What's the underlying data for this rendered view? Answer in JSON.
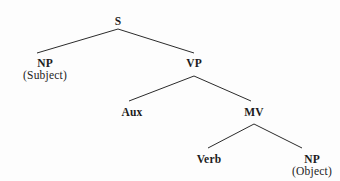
{
  "diagram": {
    "type": "syntax-tree",
    "background_color": "#fdfdfd",
    "line_color": "#2b2b2b",
    "text_color": "#1c1c1c",
    "nodes": [
      {
        "id": "s",
        "category": "S",
        "role": "",
        "x": 118,
        "y": 22
      },
      {
        "id": "np_sub",
        "category": "NP",
        "role": "(Subject)",
        "x": 45,
        "y": 63
      },
      {
        "id": "vp",
        "category": "VP",
        "role": "",
        "x": 194,
        "y": 63
      },
      {
        "id": "aux",
        "category": "Aux",
        "role": "",
        "x": 132,
        "y": 112
      },
      {
        "id": "mv",
        "category": "MV",
        "role": "",
        "x": 254,
        "y": 112
      },
      {
        "id": "verb",
        "category": "Verb",
        "role": "",
        "x": 209,
        "y": 159
      },
      {
        "id": "np_obj",
        "category": "NP",
        "role": "(Object)",
        "x": 312,
        "y": 159
      }
    ],
    "edges": [
      {
        "from": "s",
        "to": "np_sub",
        "x1": 118,
        "y1": 29,
        "x2": 37,
        "y2": 53
      },
      {
        "from": "s",
        "to": "vp",
        "x1": 118,
        "y1": 29,
        "x2": 194,
        "y2": 53
      },
      {
        "from": "vp",
        "to": "aux",
        "x1": 194,
        "y1": 76,
        "x2": 129,
        "y2": 101
      },
      {
        "from": "vp",
        "to": "mv",
        "x1": 194,
        "y1": 76,
        "x2": 251,
        "y2": 101
      },
      {
        "from": "mv",
        "to": "verb",
        "x1": 254,
        "y1": 124,
        "x2": 208,
        "y2": 148
      },
      {
        "from": "mv",
        "to": "np_obj",
        "x1": 254,
        "y1": 124,
        "x2": 302,
        "y2": 148
      }
    ]
  }
}
